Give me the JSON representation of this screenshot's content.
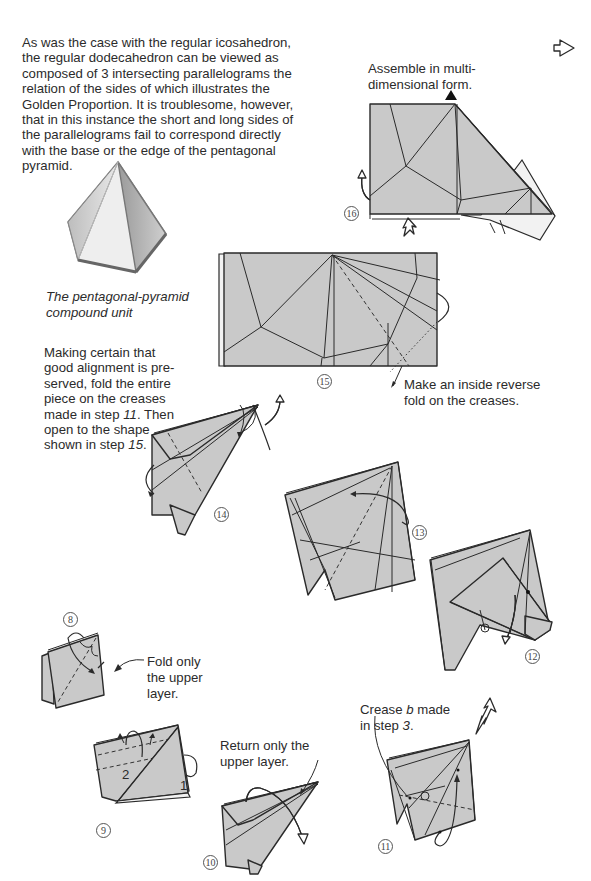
{
  "intro_text": "As was the case with the regular icosahedron, the regular dodecahedron can be viewed as composed of 3 intersecting parallelograms the relation of the sides of which illustrates the Golden Proportion. It is troublesome, however, that in this instance the short and long sides of the parallelograms fail to correspond directly with the base or the edge of the pentagonal pyramid.",
  "pyramid_caption": {
    "line1": "The pentagonal-pyramid",
    "line2": "compound unit"
  },
  "next_page_icon": "hollow-right-arrow-icon",
  "steps": {
    "s16": {
      "number": "16",
      "note_line1": "Assemble in multi-",
      "note_line2": "dimensional form."
    },
    "s15": {
      "number": "15",
      "note_line1": "Make an inside reverse",
      "note_line2": "fold on the creases."
    },
    "s14": {
      "number": "14",
      "note_lines": [
        "Making certain that",
        "good alignment is pre-",
        "served, fold the entire",
        "piece on the creases"
      ],
      "note_line5_prefix": "made in step ",
      "note_line5_ref": "11",
      "note_line5_suffix": ". Then",
      "note_line6": "open to the shape",
      "note_line7_prefix": "shown in step ",
      "note_line7_ref": "15",
      "note_line7_suffix": "."
    },
    "s13": {
      "number": "13"
    },
    "s12": {
      "number": "12"
    },
    "s8": {
      "number": "8",
      "note_line1": "Fold only",
      "note_line2": "the upper",
      "note_line3": "layer."
    },
    "s9": {
      "number": "9",
      "label_1": "1",
      "label_2": "2"
    },
    "s10": {
      "number": "10",
      "note_line1": "Return only the",
      "note_line2": "upper layer."
    },
    "s11": {
      "number": "11",
      "note_prefix": "Crease ",
      "note_ref": "b",
      "note_mid": " made",
      "note_line2_prefix": "in step ",
      "note_line2_ref": "3",
      "note_line2_suffix": "."
    }
  }
}
